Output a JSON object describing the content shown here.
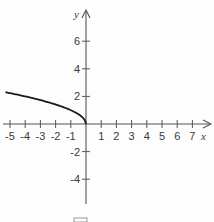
{
  "chart_data": {
    "type": "line",
    "title": "",
    "xlabel": "x",
    "ylabel": "y",
    "xlim": [
      -5.3,
      8.2
    ],
    "ylim": [
      -5.8,
      8.5
    ],
    "x_ticks": [
      -5,
      -4,
      -3,
      -2,
      -1,
      1,
      2,
      3,
      4,
      5,
      6,
      7
    ],
    "x_tick_labels": [
      "-5",
      "-4",
      "-3",
      "-2",
      "-1",
      "1",
      "2",
      "3",
      "4",
      "5",
      "6",
      "7"
    ],
    "y_ticks": [
      6,
      4,
      2,
      -2,
      -4
    ],
    "y_tick_labels": [
      "6",
      "4",
      "2",
      "-2",
      "-4"
    ],
    "grid": false,
    "legend": null,
    "series": [
      {
        "name": "y = sqrt(-x)",
        "x": [
          -5.3,
          -5,
          -4,
          -3,
          -2,
          -1,
          -0.5,
          -0.2,
          -0.05,
          0
        ],
        "y": [
          2.3,
          2.24,
          2.0,
          1.73,
          1.41,
          1.0,
          0.71,
          0.45,
          0.22,
          0
        ],
        "color": "#1a1a1a"
      }
    ]
  },
  "colors": {
    "axis": "#555555",
    "curve": "#1a1a1a",
    "text": "#3a3a3a"
  },
  "footer_box": {
    "visible": true,
    "color": "#9a9a9a"
  }
}
